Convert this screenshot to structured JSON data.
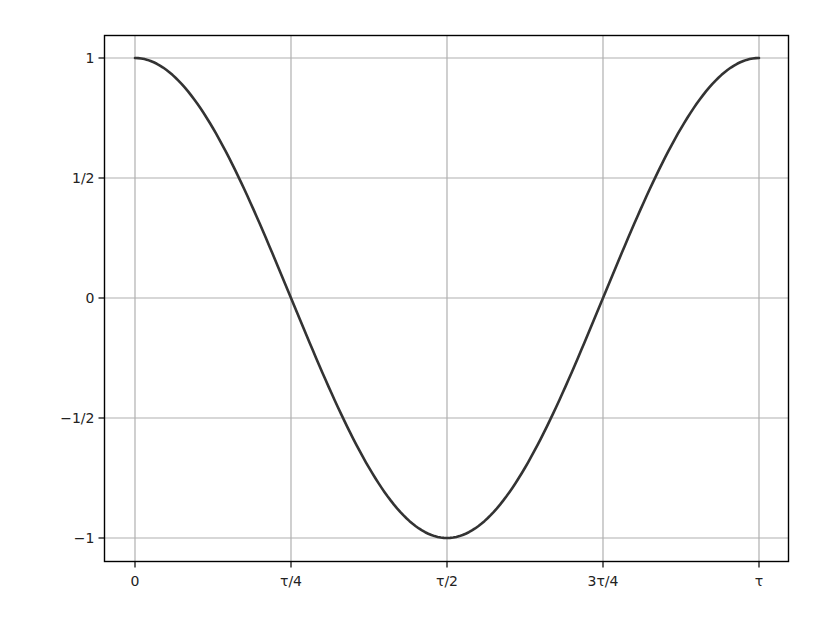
{
  "chart_data": {
    "type": "line",
    "title": "",
    "xlabel": "",
    "ylabel": "",
    "function": "cos(x)",
    "x_range": [
      0,
      6.283185307
    ],
    "xlim": [
      -0.31,
      6.6
    ],
    "ylim": [
      -1.1,
      1.1
    ],
    "grid": true,
    "legend": null,
    "x_ticks": [
      {
        "value": 0,
        "label": "0"
      },
      {
        "value": 1.5707963,
        "label": "τ/4"
      },
      {
        "value": 3.1415927,
        "label": "τ/2"
      },
      {
        "value": 4.712389,
        "label": "3τ/4"
      },
      {
        "value": 6.2831853,
        "label": "τ"
      }
    ],
    "y_ticks": [
      {
        "value": 1,
        "label": "1"
      },
      {
        "value": 0.5,
        "label": "1/2"
      },
      {
        "value": 0,
        "label": "0"
      },
      {
        "value": -0.5,
        "label": "−1/2"
      },
      {
        "value": -1,
        "label": "−1"
      }
    ],
    "series": [
      {
        "name": "cos",
        "color": "#333333",
        "x": [
          0,
          0.7854,
          1.5708,
          2.3562,
          3.1416,
          3.927,
          4.7124,
          5.4978,
          6.2832
        ],
        "values": [
          1,
          0.7071,
          0,
          -0.7071,
          -1,
          -0.7071,
          0,
          0.7071,
          1
        ]
      }
    ]
  },
  "style": {
    "curve_color": "#333333",
    "grid_color": "#b0b0b0",
    "axes_color": "#000000"
  }
}
